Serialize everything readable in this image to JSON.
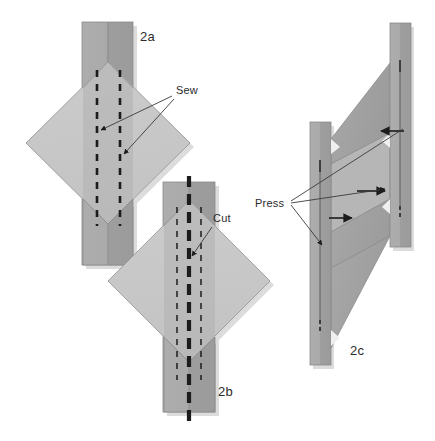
{
  "figure": {
    "background_color": "#ffffff",
    "width": 435,
    "height": 441
  },
  "palette": {
    "strip_light": "#a9a9a9",
    "strip_dark": "#9a9a9a",
    "diamond_light": "#c9c9c9",
    "diamond_shade": "#bdbdbd",
    "fold_face": "#a3a3a3",
    "fold_face_dark": "#9b9b9b",
    "outline": "#7d7d7d",
    "stitch_line": "#1c1c1c",
    "cut_line": "#1c1c1c",
    "leader_line": "#3a3a3a",
    "text": "#2b2b2b",
    "shadow": "#d8d8d8"
  },
  "panels": [
    {
      "id": "2a",
      "label": "2a",
      "label_x": 140,
      "label_y": 41,
      "description": "Vertical strip with diamond patch centered; two dashed sewing lines",
      "strip": {
        "x": 82,
        "y": 22,
        "width": 51,
        "height": 243
      },
      "diamond": {
        "cx": 108,
        "cy": 143,
        "rx": 82,
        "ry": 81
      },
      "stitch_lines": [
        {
          "name": "left-stitch",
          "x": 97,
          "y1": 70,
          "y2": 226
        },
        {
          "name": "right-stitch",
          "x": 120,
          "y1": 70,
          "y2": 226
        }
      ]
    },
    {
      "id": "2b",
      "label": "2b",
      "label_x": 218,
      "label_y": 396,
      "description": "Vertical strip with diamond patch; thick dashed cut line down the center",
      "strip": {
        "x": 163,
        "y": 182,
        "width": 52,
        "height": 230
      },
      "diamond": {
        "cx": 189,
        "cy": 281,
        "rx": 81,
        "ry": 81
      },
      "stitch_lines": [
        {
          "name": "left-stitch",
          "x": 177,
          "y1": 207,
          "y2": 380
        },
        {
          "name": "right-stitch",
          "x": 201,
          "y1": 207,
          "y2": 380
        }
      ],
      "cut_line": {
        "name": "center-cut",
        "x": 189,
        "y1": 176,
        "y2": 426
      }
    },
    {
      "id": "2c",
      "label": "2c",
      "label_x": 352,
      "label_y": 355,
      "description": "Two vertical strips joined by a zigzag folded band; press arrows indicate direction",
      "left_strip": {
        "x": 310,
        "y": 122,
        "width": 21,
        "height": 243
      },
      "right_strip": {
        "x": 390,
        "y": 23,
        "width": 21,
        "height": 224
      }
    }
  ],
  "callouts": [
    {
      "id": "sew",
      "label": "Sew",
      "label_x": 176,
      "label_y": 94,
      "panel": "2a",
      "arrow_count": 2,
      "arrow_targets": [
        {
          "x": 98,
          "y": 130
        },
        {
          "x": 121,
          "y": 153
        }
      ]
    },
    {
      "id": "cut",
      "label": "Cut",
      "label_x": 213,
      "label_y": 222,
      "panel": "2b",
      "arrow_count": 1,
      "arrow_targets": [
        {
          "x": 189,
          "y": 258
        }
      ]
    },
    {
      "id": "press",
      "label": "Press",
      "label_x": 258,
      "label_y": 207,
      "panel": "2c",
      "arrow_count": 4,
      "arrow_targets": [
        {
          "x": 384,
          "y": 131
        },
        {
          "x": 381,
          "y": 191
        },
        {
          "x": 340,
          "y": 218
        },
        {
          "x": 325,
          "y": 243
        }
      ]
    }
  ]
}
